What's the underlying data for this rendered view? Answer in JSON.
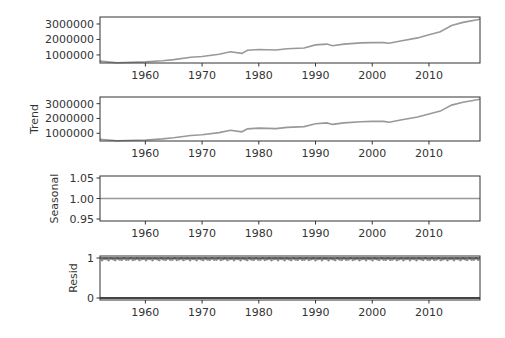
{
  "chart_data": [
    {
      "type": "line",
      "panel": "observed",
      "title": "",
      "xlabel": "",
      "ylabel": "",
      "xlim": [
        1952,
        2019
      ],
      "ylim": [
        480000,
        3450000
      ],
      "xticks": [
        1960,
        1970,
        1980,
        1990,
        2000,
        2010
      ],
      "xtick_labels": [
        "1960",
        "1970",
        "1980",
        "1990",
        "2000",
        "2010"
      ],
      "yticks": [
        1000000,
        2000000,
        3000000
      ],
      "ytick_labels": [
        "1000000",
        "2000000",
        "3000000"
      ],
      "x": [
        1952,
        1955,
        1960,
        1963,
        1965,
        1968,
        1970,
        1973,
        1975,
        1977,
        1978,
        1980,
        1983,
        1985,
        1988,
        1990,
        1992,
        1993,
        1995,
        1998,
        2000,
        2002,
        2003,
        2005,
        2008,
        2010,
        2012,
        2014,
        2016,
        2019
      ],
      "values": [
        600000,
        500000,
        550000,
        620000,
        700000,
        850000,
        900000,
        1050000,
        1200000,
        1100000,
        1300000,
        1350000,
        1320000,
        1400000,
        1450000,
        1650000,
        1700000,
        1600000,
        1700000,
        1780000,
        1800000,
        1800000,
        1750000,
        1900000,
        2100000,
        2300000,
        2500000,
        2900000,
        3100000,
        3300000
      ],
      "grid": false,
      "color": "#999999"
    },
    {
      "type": "line",
      "panel": "trend",
      "ylabel": "Trend",
      "xlim": [
        1952,
        2019
      ],
      "ylim": [
        480000,
        3450000
      ],
      "xticks": [
        1960,
        1970,
        1980,
        1990,
        2000,
        2010
      ],
      "xtick_labels": [
        "1960",
        "1970",
        "1980",
        "1990",
        "2000",
        "2010"
      ],
      "yticks": [
        1000000,
        2000000,
        3000000
      ],
      "ytick_labels": [
        "1000000",
        "2000000",
        "3000000"
      ],
      "x": [
        1952,
        1955,
        1960,
        1963,
        1965,
        1968,
        1970,
        1973,
        1975,
        1977,
        1978,
        1980,
        1983,
        1985,
        1988,
        1990,
        1992,
        1993,
        1995,
        1998,
        2000,
        2002,
        2003,
        2005,
        2008,
        2010,
        2012,
        2014,
        2016,
        2019
      ],
      "values": [
        600000,
        500000,
        550000,
        620000,
        700000,
        850000,
        900000,
        1050000,
        1200000,
        1100000,
        1300000,
        1350000,
        1320000,
        1400000,
        1450000,
        1650000,
        1700000,
        1600000,
        1700000,
        1780000,
        1800000,
        1800000,
        1750000,
        1900000,
        2100000,
        2300000,
        2500000,
        2900000,
        3100000,
        3300000
      ],
      "grid": false,
      "color": "#999999"
    },
    {
      "type": "line",
      "panel": "seasonal",
      "ylabel": "Seasonal",
      "xlim": [
        1952,
        2019
      ],
      "ylim": [
        0.95,
        1.05
      ],
      "xticks": [
        1960,
        1970,
        1980,
        1990,
        2000,
        2010
      ],
      "xtick_labels": [
        "1960",
        "1970",
        "1980",
        "1990",
        "2000",
        "2010"
      ],
      "yticks": [
        0.95,
        1.0,
        1.05
      ],
      "ytick_labels": [
        "0.95",
        "1.00",
        "1.05"
      ],
      "x": [
        1952,
        2019
      ],
      "values": [
        1.0,
        1.0
      ],
      "grid": false,
      "color": "#999999"
    },
    {
      "type": "scatter",
      "panel": "resid",
      "ylabel": "Resid",
      "xlim": [
        1952,
        2019
      ],
      "ylim": [
        0,
        1
      ],
      "xticks": [
        1960,
        1970,
        1980,
        1990,
        2000,
        2010
      ],
      "xtick_labels": [
        "1960",
        "1970",
        "1980",
        "1990",
        "2000",
        "2010"
      ],
      "yticks": [
        0,
        1
      ],
      "ytick_labels": [
        "0",
        "1"
      ],
      "description": "dense residual markers clustered near 0.95-1.0 across all years, baseline line at 0",
      "resid_level": 0.97,
      "baseline": 0,
      "grid": false,
      "color": "#999999"
    }
  ],
  "labels": {
    "panel1_ylabel": "",
    "panel2_ylabel": "Trend",
    "panel3_ylabel": "Seasonal",
    "panel4_ylabel": "Resid"
  }
}
